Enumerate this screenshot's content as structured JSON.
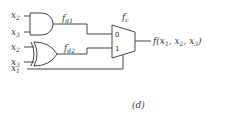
{
  "diagram": {
    "inputs": [
      {
        "id": "and_in_a",
        "var": "x",
        "sub": "2"
      },
      {
        "id": "and_in_b",
        "var": "x",
        "sub": "3"
      },
      {
        "id": "xor_in_a",
        "var": "x",
        "sub": "2"
      },
      {
        "id": "xor_in_b",
        "var": "x",
        "sub": "3"
      },
      {
        "id": "select",
        "var": "x",
        "sub": "1"
      }
    ],
    "gates": [
      {
        "type": "AND",
        "output_label": {
          "var": "f",
          "sub": "d1"
        }
      },
      {
        "type": "XOR",
        "output_label": {
          "var": "f",
          "sub": "d2"
        }
      }
    ],
    "mux": {
      "label": {
        "var": "f",
        "sub": "c"
      },
      "input0": "0",
      "input1": "1"
    },
    "output": "f(x₁, x₂, x₃)",
    "output_parts": {
      "func": "f(",
      "a": "x",
      "a_sub": "1",
      "sep1": ", ",
      "b": "x",
      "b_sub": "2",
      "sep2": ", ",
      "c": "x",
      "c_sub": "3",
      "close": ")"
    },
    "caption": "(d)"
  }
}
